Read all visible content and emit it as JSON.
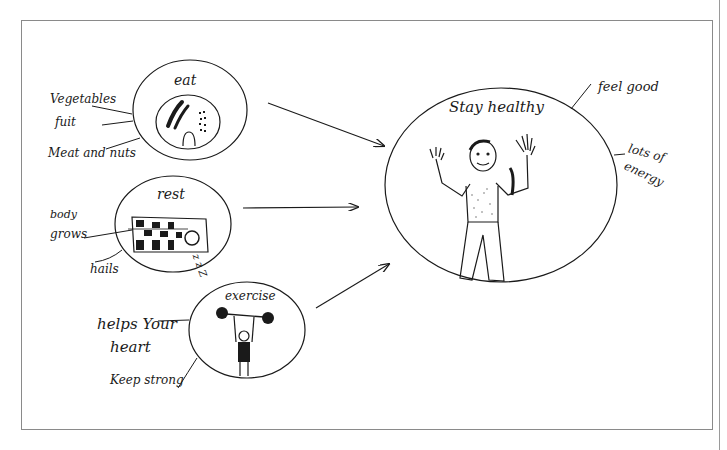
{
  "diagram": {
    "type": "concept-map",
    "style": "hand-drawn",
    "nodes": {
      "eat": {
        "title": "eat",
        "notes": [
          "Vegetables",
          "fuit",
          "Meat and nuts"
        ]
      },
      "rest": {
        "title": "rest",
        "notes": [
          "body",
          "grows",
          "hails"
        ],
        "sleep_mark": "z z Z"
      },
      "exercise": {
        "title": "exercise",
        "notes": [
          "helps Your",
          "heart",
          "Keep strong"
        ]
      },
      "goal": {
        "title": "Stay healthy",
        "notes": [
          "feel good",
          "lots of",
          "energy"
        ]
      }
    },
    "edges": [
      {
        "from": "eat",
        "to": "goal"
      },
      {
        "from": "rest",
        "to": "goal"
      },
      {
        "from": "exercise",
        "to": "goal"
      }
    ],
    "colors": {
      "ink": "#1a1a1a",
      "frame": "#8a8a8a",
      "background": "#ffffff"
    }
  }
}
